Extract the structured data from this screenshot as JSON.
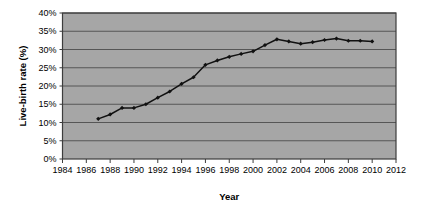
{
  "chart_data": {
    "type": "line",
    "title": "",
    "xlabel": "Year",
    "ylabel": "Live-birth rate (%)",
    "xlim": [
      1984,
      2012
    ],
    "ylim": [
      0,
      40
    ],
    "grid": true,
    "legend": "none",
    "xticks": [
      1984,
      1986,
      1988,
      1990,
      1992,
      1994,
      1996,
      1998,
      2000,
      2002,
      2004,
      2006,
      2008,
      2010,
      2012
    ],
    "xtick_labels": [
      "1984",
      "1986",
      "1988",
      "1990",
      "1992",
      "1994",
      "1996",
      "1998",
      "2000",
      "2002",
      "2004",
      "2006",
      "2008",
      "2010",
      "2012"
    ],
    "yticks": [
      0,
      5,
      10,
      15,
      20,
      25,
      30,
      35,
      40
    ],
    "ytick_labels": [
      "0%",
      "5%",
      "10%",
      "15%",
      "20%",
      "25%",
      "30%",
      "35%",
      "40%"
    ],
    "x": [
      1987,
      1988,
      1989,
      1990,
      1991,
      1992,
      1993,
      1994,
      1995,
      1996,
      1997,
      1998,
      1999,
      2000,
      2001,
      2002,
      2003,
      2004,
      2005,
      2006,
      2007,
      2008,
      2009,
      2010
    ],
    "values": [
      11.0,
      12.2,
      14.0,
      14.0,
      15.0,
      16.8,
      18.5,
      20.6,
      22.4,
      25.8,
      27.0,
      28.0,
      28.8,
      29.5,
      31.2,
      32.8,
      32.2,
      31.6,
      32.0,
      32.6,
      33.0,
      32.4,
      32.4,
      32.2
    ],
    "marker": "diamond",
    "line_color": "#111111",
    "plot_background": "#a6a6a6",
    "gridline_color": "#4d4d4d",
    "page_background": "#ffffff"
  }
}
